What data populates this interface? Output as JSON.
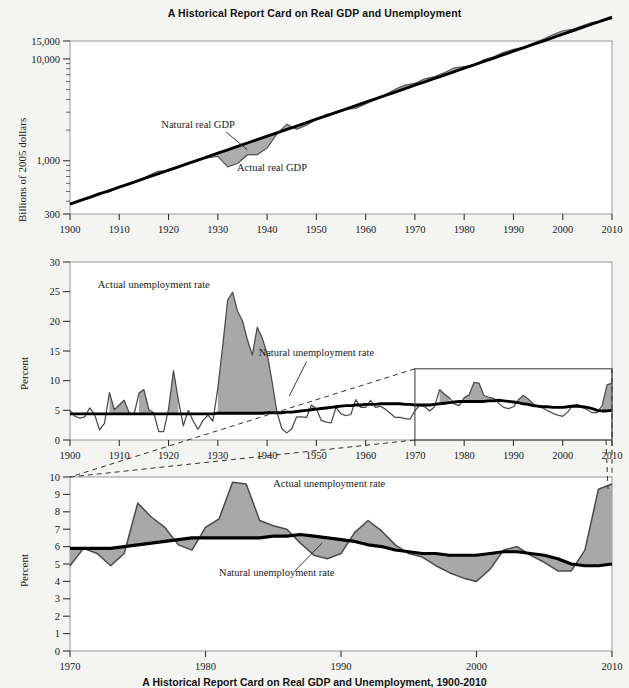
{
  "figure": {
    "title": "A Historical Report Card on Real GDP and Unemployment",
    "caption": "A Historical Report Card on Real GDP and Unemployment, 1900-2010",
    "background_color": "#f4f4f2",
    "plot_background": "#ffffff",
    "line_color": "#000000",
    "gap_fill_color": "#a8a8a8"
  },
  "chart_data": [
    {
      "type": "line",
      "panel": "top",
      "title": "A Historical Report Card on Real GDP and Unemployment",
      "xlabel": "",
      "ylabel": "Billions of 2005 dollars",
      "yscale": "log",
      "ylim": [
        300,
        15000
      ],
      "xlim": [
        1900,
        2010
      ],
      "grid": false,
      "ytick_labels": [
        "15,000",
        "10,000",
        "1,000",
        "300"
      ],
      "ytick_values": [
        15000,
        10000,
        1000,
        300
      ],
      "xtick_labels": [
        "1900",
        "1910",
        "1920",
        "1930",
        "1940",
        "1950",
        "1960",
        "1970",
        "1980",
        "1990",
        "2000",
        "2010"
      ],
      "xtick_values": [
        1900,
        1910,
        1920,
        1930,
        1940,
        1950,
        1960,
        1970,
        1980,
        1990,
        2000,
        2010
      ],
      "annotations": [
        {
          "text": "Natural real GDP",
          "x": 1926,
          "y": 2100
        },
        {
          "text": "Actual real GDP",
          "x": 1941,
          "y": 800
        }
      ],
      "x": [
        1900,
        1902,
        1904,
        1906,
        1908,
        1910,
        1912,
        1914,
        1916,
        1918,
        1920,
        1922,
        1924,
        1926,
        1928,
        1930,
        1932,
        1934,
        1936,
        1938,
        1940,
        1942,
        1944,
        1946,
        1948,
        1950,
        1952,
        1954,
        1956,
        1958,
        1960,
        1962,
        1964,
        1966,
        1968,
        1970,
        1972,
        1974,
        1976,
        1978,
        1980,
        1982,
        1984,
        1986,
        1988,
        1990,
        1992,
        1994,
        1996,
        1998,
        2000,
        2002,
        2004,
        2006,
        2008,
        2010
      ],
      "series": [
        {
          "name": "Natural real GDP",
          "values": [
            375,
            405,
            437,
            472,
            510,
            550,
            594,
            642,
            693,
            748,
            808,
            872,
            942,
            1017,
            1098,
            1186,
            1281,
            1383,
            1494,
            1613,
            1742,
            1881,
            2032,
            2194,
            2369,
            2558,
            2763,
            2983,
            3222,
            3479,
            3757,
            4057,
            4381,
            4731,
            5110,
            5518,
            5959,
            6435,
            6950,
            7505,
            8104,
            8751,
            9450,
            10206,
            11022,
            11903,
            12855,
            13883,
            14993,
            16192,
            17487,
            18886,
            20397,
            22029,
            23792,
            25696
          ]
        },
        {
          "name": "Actual real GDP",
          "values": [
            370,
            400,
            440,
            487,
            495,
            558,
            600,
            630,
            716,
            790,
            790,
            860,
            930,
            1030,
            1075,
            1105,
            870,
            940,
            1140,
            1150,
            1330,
            1840,
            2290,
            2040,
            2230,
            2560,
            2860,
            2920,
            3210,
            3260,
            3620,
            4000,
            4450,
            5040,
            5530,
            5760,
            6380,
            6700,
            7330,
            8200,
            8400,
            8630,
            9800,
            10500,
            11600,
            12400,
            13000,
            14200,
            15600,
            17300,
            18900,
            19500,
            21200,
            22900,
            23500,
            24800
          ]
        }
      ]
    },
    {
      "type": "line",
      "panel": "middle",
      "title": "",
      "xlabel": "",
      "ylabel": "Percent",
      "yscale": "linear",
      "ylim": [
        0,
        30
      ],
      "xlim": [
        1900,
        2010
      ],
      "grid": false,
      "ytick_labels": [
        "0",
        "5",
        "10",
        "15",
        "20",
        "25",
        "30"
      ],
      "ytick_values": [
        0,
        5,
        10,
        15,
        20,
        25,
        30
      ],
      "xtick_labels": [
        "1900",
        "1910",
        "1920",
        "1930",
        "1940",
        "1950",
        "1960",
        "1970",
        "1980",
        "1990",
        "2000",
        "2010"
      ],
      "xtick_values": [
        1900,
        1910,
        1920,
        1930,
        1940,
        1950,
        1960,
        1970,
        1980,
        1990,
        2000,
        2010
      ],
      "annotations": [
        {
          "text": "Actual unemployment rate",
          "x": 1917,
          "y": 25.6
        },
        {
          "text": "Natural unemployment rate",
          "x": 1950,
          "y": 14.2
        }
      ],
      "inset_box": {
        "x0": 1970,
        "x1": 2010,
        "y0": 0,
        "y1": 12
      },
      "x": [
        1900,
        1901,
        1902,
        1903,
        1904,
        1905,
        1906,
        1907,
        1908,
        1909,
        1910,
        1911,
        1912,
        1913,
        1914,
        1915,
        1916,
        1917,
        1918,
        1919,
        1920,
        1921,
        1922,
        1923,
        1924,
        1925,
        1926,
        1927,
        1928,
        1929,
        1930,
        1931,
        1932,
        1933,
        1934,
        1935,
        1936,
        1937,
        1938,
        1939,
        1940,
        1941,
        1942,
        1943,
        1944,
        1945,
        1946,
        1947,
        1948,
        1949,
        1950,
        1951,
        1952,
        1953,
        1954,
        1955,
        1956,
        1957,
        1958,
        1959,
        1960,
        1961,
        1962,
        1963,
        1964,
        1965,
        1966,
        1967,
        1968,
        1969,
        1970,
        1971,
        1972,
        1973,
        1974,
        1975,
        1976,
        1977,
        1978,
        1979,
        1980,
        1981,
        1982,
        1983,
        1984,
        1985,
        1986,
        1987,
        1988,
        1989,
        1990,
        1991,
        1992,
        1993,
        1994,
        1995,
        1996,
        1997,
        1998,
        1999,
        2000,
        2001,
        2002,
        2003,
        2004,
        2005,
        2006,
        2007,
        2008,
        2009,
        2010
      ],
      "series": [
        {
          "name": "Actual unemployment rate",
          "values": [
            5.0,
            4.0,
            3.7,
            3.9,
            5.4,
            4.3,
            1.7,
            2.8,
            8.0,
            5.1,
            5.9,
            6.7,
            4.6,
            4.3,
            7.9,
            8.5,
            5.1,
            4.6,
            1.4,
            1.4,
            5.2,
            11.7,
            6.7,
            2.4,
            5.0,
            3.2,
            1.8,
            3.3,
            4.2,
            3.2,
            8.7,
            15.9,
            23.6,
            24.9,
            21.7,
            20.1,
            16.9,
            14.3,
            19.0,
            17.2,
            14.6,
            9.9,
            4.7,
            1.9,
            1.2,
            1.9,
            3.9,
            3.9,
            3.8,
            5.9,
            5.3,
            3.3,
            3.0,
            2.9,
            5.5,
            4.4,
            4.1,
            4.3,
            6.8,
            5.5,
            5.5,
            6.7,
            5.5,
            5.7,
            5.2,
            4.5,
            3.8,
            3.8,
            3.6,
            3.5,
            4.9,
            5.9,
            5.6,
            4.9,
            5.6,
            8.5,
            7.7,
            7.1,
            6.1,
            5.8,
            7.1,
            7.6,
            9.7,
            9.6,
            7.5,
            7.2,
            7.0,
            6.2,
            5.5,
            5.3,
            5.6,
            6.8,
            7.5,
            6.9,
            6.1,
            5.6,
            5.4,
            4.9,
            4.5,
            4.2,
            4.0,
            4.7,
            5.8,
            6.0,
            5.5,
            5.1,
            4.6,
            4.6,
            5.8,
            9.3,
            9.6
          ]
        },
        {
          "name": "Natural unemployment rate",
          "values": [
            4.4,
            4.4,
            4.4,
            4.4,
            4.4,
            4.4,
            4.4,
            4.4,
            4.4,
            4.4,
            4.4,
            4.4,
            4.4,
            4.4,
            4.4,
            4.4,
            4.4,
            4.4,
            4.4,
            4.4,
            4.4,
            4.4,
            4.4,
            4.4,
            4.4,
            4.4,
            4.4,
            4.4,
            4.4,
            4.4,
            4.5,
            4.5,
            4.5,
            4.5,
            4.5,
            4.5,
            4.5,
            4.5,
            4.5,
            4.5,
            4.6,
            4.6,
            4.6,
            4.6,
            4.7,
            4.7,
            4.8,
            4.9,
            5.0,
            5.1,
            5.2,
            5.3,
            5.4,
            5.5,
            5.6,
            5.7,
            5.8,
            5.8,
            5.9,
            5.9,
            6.0,
            6.0,
            6.0,
            6.1,
            6.1,
            6.1,
            6.1,
            6.1,
            6.0,
            6.0,
            5.9,
            5.9,
            5.9,
            5.9,
            6.0,
            6.1,
            6.2,
            6.3,
            6.4,
            6.5,
            6.5,
            6.5,
            6.5,
            6.5,
            6.5,
            6.6,
            6.6,
            6.7,
            6.6,
            6.5,
            6.4,
            6.3,
            6.1,
            6.0,
            5.8,
            5.7,
            5.6,
            5.6,
            5.5,
            5.5,
            5.5,
            5.6,
            5.7,
            5.7,
            5.6,
            5.5,
            5.3,
            5.0,
            4.9,
            4.9,
            5.0
          ]
        }
      ]
    },
    {
      "type": "line",
      "panel": "bottom",
      "title": "",
      "xlabel": "",
      "ylabel": "Percent",
      "yscale": "linear",
      "ylim": [
        0,
        10
      ],
      "xlim": [
        1970,
        2010
      ],
      "grid": false,
      "ytick_labels": [
        "0",
        "1",
        "2",
        "3",
        "4",
        "5",
        "6",
        "7",
        "8",
        "9",
        "10"
      ],
      "ytick_values": [
        0,
        1,
        2,
        3,
        4,
        5,
        6,
        7,
        8,
        9,
        10
      ],
      "xtick_labels": [
        "1970",
        "1980",
        "1990",
        "2000",
        "2010"
      ],
      "xtick_values": [
        1970,
        1980,
        1990,
        2000,
        2010
      ],
      "annotations": [
        {
          "text": "Actual unemployment rate",
          "x": 1985,
          "y": 9.4
        },
        {
          "text": "Natural unemployment rate",
          "x": 1981,
          "y": 4.3
        }
      ],
      "x": [
        1970,
        1971,
        1972,
        1973,
        1974,
        1975,
        1976,
        1977,
        1978,
        1979,
        1980,
        1981,
        1982,
        1983,
        1984,
        1985,
        1986,
        1987,
        1988,
        1989,
        1990,
        1991,
        1992,
        1993,
        1994,
        1995,
        1996,
        1997,
        1998,
        1999,
        2000,
        2001,
        2002,
        2003,
        2004,
        2005,
        2006,
        2007,
        2008,
        2009,
        2010
      ],
      "series": [
        {
          "name": "Actual unemployment rate",
          "values": [
            4.9,
            5.9,
            5.6,
            4.9,
            5.6,
            8.5,
            7.7,
            7.1,
            6.1,
            5.8,
            7.1,
            7.6,
            9.7,
            9.6,
            7.5,
            7.2,
            7.0,
            6.2,
            5.5,
            5.3,
            5.6,
            6.8,
            7.5,
            6.9,
            6.1,
            5.6,
            5.4,
            4.9,
            4.5,
            4.2,
            4.0,
            4.7,
            5.8,
            6.0,
            5.5,
            5.1,
            4.6,
            4.6,
            5.8,
            9.3,
            9.6
          ]
        },
        {
          "name": "Natural unemployment rate",
          "values": [
            5.9,
            5.9,
            5.9,
            5.9,
            6.0,
            6.1,
            6.2,
            6.3,
            6.4,
            6.5,
            6.5,
            6.5,
            6.5,
            6.5,
            6.5,
            6.6,
            6.6,
            6.7,
            6.6,
            6.5,
            6.4,
            6.3,
            6.1,
            6.0,
            5.8,
            5.7,
            5.6,
            5.6,
            5.5,
            5.5,
            5.5,
            5.6,
            5.7,
            5.7,
            5.6,
            5.5,
            5.3,
            5.0,
            4.9,
            4.9,
            5.0
          ]
        }
      ]
    }
  ]
}
